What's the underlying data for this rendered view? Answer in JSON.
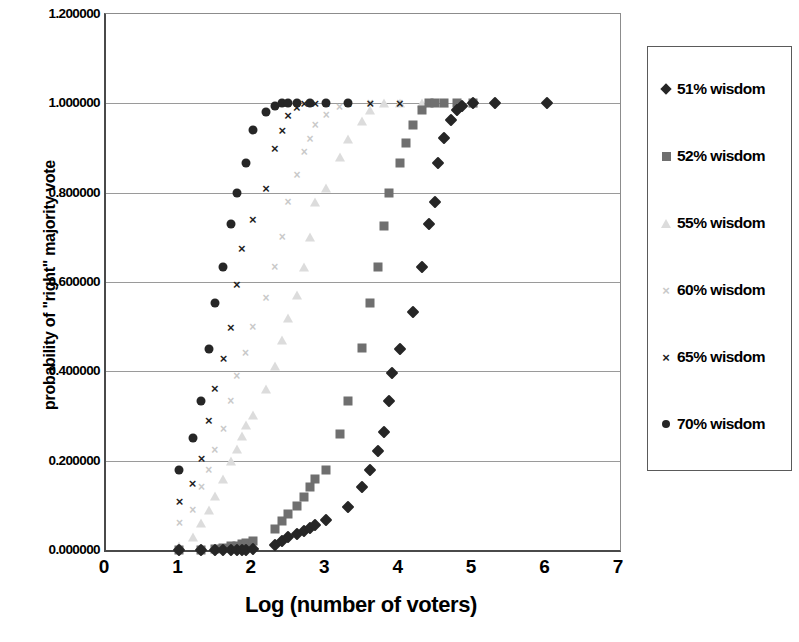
{
  "chart_data": {
    "type": "scatter",
    "title": "",
    "xlabel": "Log (number of voters)",
    "ylabel": "probability of \"right\" majority vote",
    "xlim": [
      0,
      7
    ],
    "ylim": [
      0,
      1.2
    ],
    "xticks": [
      "0",
      "1",
      "2",
      "3",
      "4",
      "5",
      "6",
      "7"
    ],
    "yticks": [
      "0.000000",
      "0.200000",
      "0.400000",
      "0.600000",
      "0.800000",
      "1.000000",
      "1.200000"
    ],
    "ytick_values": [
      0,
      0.2,
      0.4,
      0.6,
      0.8,
      1.0,
      1.2
    ],
    "grid": "horizontal",
    "legend_position": "right",
    "series": [
      {
        "name": "51% wisdom",
        "marker": "diamond",
        "color": "#262626",
        "points": [
          [
            1.0,
            0.0
          ],
          [
            1.3,
            0.0
          ],
          [
            1.48,
            0.0
          ],
          [
            1.6,
            0.0
          ],
          [
            1.7,
            0.0
          ],
          [
            1.78,
            0.0
          ],
          [
            1.85,
            0.0
          ],
          [
            1.9,
            0.0
          ],
          [
            2.0,
            0.003
          ],
          [
            2.3,
            0.012
          ],
          [
            2.4,
            0.02
          ],
          [
            2.48,
            0.028
          ],
          [
            2.6,
            0.036
          ],
          [
            2.7,
            0.043
          ],
          [
            2.78,
            0.05
          ],
          [
            2.85,
            0.056
          ],
          [
            3.0,
            0.068
          ],
          [
            3.3,
            0.097
          ],
          [
            3.48,
            0.14
          ],
          [
            3.6,
            0.178
          ],
          [
            3.7,
            0.222
          ],
          [
            3.78,
            0.265
          ],
          [
            3.85,
            0.333
          ],
          [
            3.9,
            0.396
          ],
          [
            4.0,
            0.451
          ],
          [
            4.18,
            0.533
          ],
          [
            4.3,
            0.634
          ],
          [
            4.4,
            0.73
          ],
          [
            4.48,
            0.778
          ],
          [
            4.52,
            0.866
          ],
          [
            4.6,
            0.922
          ],
          [
            4.7,
            0.962
          ],
          [
            4.78,
            0.985
          ],
          [
            4.85,
            0.995
          ],
          [
            5.0,
            1.0
          ],
          [
            5.3,
            1.0
          ],
          [
            6.0,
            1.0
          ]
        ]
      },
      {
        "name": "52% wisdom",
        "marker": "square",
        "color": "#6f6f6f",
        "points": [
          [
            1.0,
            0.0
          ],
          [
            1.3,
            0.0
          ],
          [
            1.48,
            0.003
          ],
          [
            1.6,
            0.005
          ],
          [
            1.7,
            0.008
          ],
          [
            1.78,
            0.01
          ],
          [
            1.85,
            0.013
          ],
          [
            1.9,
            0.015
          ],
          [
            2.0,
            0.021
          ],
          [
            2.3,
            0.047
          ],
          [
            2.4,
            0.066
          ],
          [
            2.48,
            0.08
          ],
          [
            2.6,
            0.098
          ],
          [
            2.7,
            0.118
          ],
          [
            2.78,
            0.14
          ],
          [
            2.85,
            0.16
          ],
          [
            3.0,
            0.18
          ],
          [
            3.18,
            0.26
          ],
          [
            3.3,
            0.333
          ],
          [
            3.48,
            0.452
          ],
          [
            3.6,
            0.553
          ],
          [
            3.7,
            0.634
          ],
          [
            3.78,
            0.725
          ],
          [
            3.85,
            0.8
          ],
          [
            4.0,
            0.866
          ],
          [
            4.08,
            0.912
          ],
          [
            4.18,
            0.952
          ],
          [
            4.3,
            0.985
          ],
          [
            4.4,
            1.0
          ],
          [
            4.48,
            1.0
          ],
          [
            4.6,
            1.0
          ],
          [
            4.78,
            1.0
          ],
          [
            5.0,
            1.0
          ]
        ]
      },
      {
        "name": "55% wisdom",
        "marker": "triangle",
        "color": "#dcdcdc",
        "points": [
          [
            1.0,
            0.01
          ],
          [
            1.18,
            0.03
          ],
          [
            1.3,
            0.06
          ],
          [
            1.4,
            0.09
          ],
          [
            1.48,
            0.12
          ],
          [
            1.6,
            0.16
          ],
          [
            1.7,
            0.2
          ],
          [
            1.78,
            0.226
          ],
          [
            1.85,
            0.256
          ],
          [
            1.9,
            0.28
          ],
          [
            2.0,
            0.302
          ],
          [
            2.18,
            0.36
          ],
          [
            2.3,
            0.412
          ],
          [
            2.4,
            0.47
          ],
          [
            2.48,
            0.52
          ],
          [
            2.6,
            0.57
          ],
          [
            2.7,
            0.634
          ],
          [
            2.78,
            0.7
          ],
          [
            2.85,
            0.778
          ],
          [
            3.0,
            0.81
          ],
          [
            3.18,
            0.88
          ],
          [
            3.3,
            0.92
          ],
          [
            3.48,
            0.96
          ],
          [
            3.6,
            0.985
          ],
          [
            3.78,
            1.0
          ],
          [
            4.0,
            1.0
          ],
          [
            4.3,
            1.0
          ],
          [
            4.6,
            1.0
          ],
          [
            5.0,
            1.0
          ]
        ]
      },
      {
        "name": "60% wisdom",
        "marker": "x-light",
        "color": "#c9c9c9",
        "points": [
          [
            1.0,
            0.06
          ],
          [
            1.18,
            0.09
          ],
          [
            1.3,
            0.14
          ],
          [
            1.4,
            0.18
          ],
          [
            1.48,
            0.225
          ],
          [
            1.6,
            0.272
          ],
          [
            1.7,
            0.333
          ],
          [
            1.78,
            0.39
          ],
          [
            1.9,
            0.44
          ],
          [
            2.0,
            0.5
          ],
          [
            2.18,
            0.565
          ],
          [
            2.3,
            0.634
          ],
          [
            2.4,
            0.7
          ],
          [
            2.48,
            0.778
          ],
          [
            2.6,
            0.84
          ],
          [
            2.7,
            0.892
          ],
          [
            2.78,
            0.92
          ],
          [
            2.85,
            0.952
          ],
          [
            3.0,
            0.975
          ],
          [
            3.18,
            0.992
          ],
          [
            3.3,
            1.0
          ],
          [
            3.6,
            1.0
          ],
          [
            4.0,
            1.0
          ],
          [
            4.48,
            1.0
          ]
        ]
      },
      {
        "name": "65% wisdom",
        "marker": "x-dark",
        "color": "#1f1f1f",
        "points": [
          [
            1.0,
            0.11
          ],
          [
            1.18,
            0.15
          ],
          [
            1.3,
            0.205
          ],
          [
            1.4,
            0.29
          ],
          [
            1.48,
            0.363
          ],
          [
            1.6,
            0.43
          ],
          [
            1.7,
            0.5
          ],
          [
            1.78,
            0.595
          ],
          [
            1.85,
            0.676
          ],
          [
            2.0,
            0.74
          ],
          [
            2.18,
            0.81
          ],
          [
            2.3,
            0.9
          ],
          [
            2.4,
            0.94
          ],
          [
            2.48,
            0.975
          ],
          [
            2.6,
            0.992
          ],
          [
            2.7,
            1.0
          ],
          [
            2.85,
            1.0
          ],
          [
            3.0,
            1.0
          ],
          [
            3.3,
            1.0
          ],
          [
            3.6,
            1.0
          ],
          [
            4.0,
            1.0
          ]
        ]
      },
      {
        "name": "70% wisdom",
        "marker": "circle",
        "color": "#262626",
        "points": [
          [
            1.0,
            0.18
          ],
          [
            1.18,
            0.25
          ],
          [
            1.3,
            0.333
          ],
          [
            1.4,
            0.45
          ],
          [
            1.48,
            0.553
          ],
          [
            1.6,
            0.634
          ],
          [
            1.7,
            0.73
          ],
          [
            1.78,
            0.8
          ],
          [
            1.9,
            0.866
          ],
          [
            2.0,
            0.94
          ],
          [
            2.18,
            0.98
          ],
          [
            2.3,
            0.995
          ],
          [
            2.4,
            1.0
          ],
          [
            2.48,
            1.0
          ],
          [
            2.6,
            1.0
          ],
          [
            2.78,
            1.0
          ],
          [
            3.0,
            1.0
          ],
          [
            3.3,
            1.0
          ]
        ]
      }
    ],
    "legend_entries": [
      {
        "label": "51% wisdom",
        "marker": "diamond",
        "color": "#262626"
      },
      {
        "label": "52% wisdom",
        "marker": "square",
        "color": "#6f6f6f"
      },
      {
        "label": "55% wisdom",
        "marker": "triangle",
        "color": "#dcdcdc"
      },
      {
        "label": "60% wisdom",
        "marker": "x-light",
        "color": "#c9c9c9"
      },
      {
        "label": "65% wisdom",
        "marker": "x-dark",
        "color": "#1f1f1f"
      },
      {
        "label": "70% wisdom",
        "marker": "circle",
        "color": "#262626"
      }
    ]
  }
}
